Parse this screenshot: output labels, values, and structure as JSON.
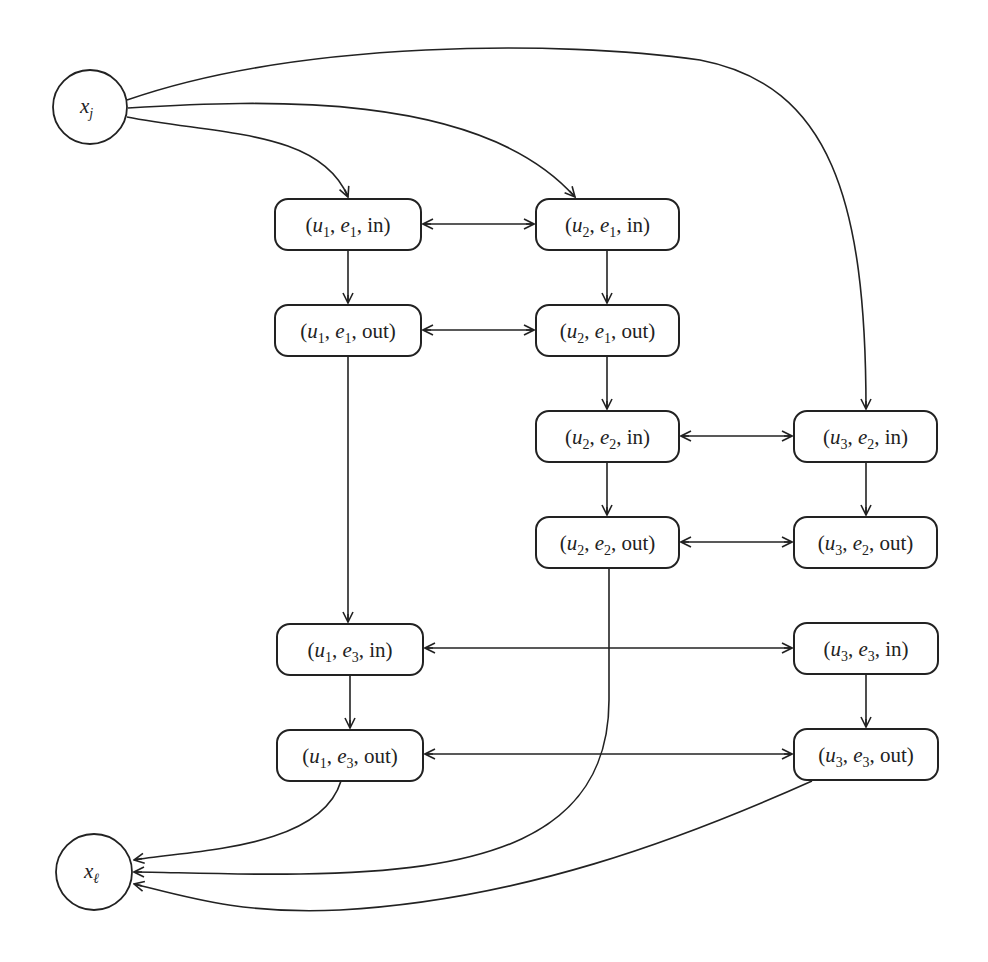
{
  "diagram": {
    "stroke_color": "#222222",
    "background": "#ffffff",
    "circle_nodes": [
      {
        "id": "xj",
        "var": "x",
        "sub": "j",
        "cx": 90,
        "cy": 107,
        "r": 37
      },
      {
        "id": "xl",
        "var": "x",
        "sub": "ℓ",
        "cx": 94,
        "cy": 872,
        "r": 38
      }
    ],
    "box_nodes": [
      {
        "id": "u1e1in",
        "u": "1",
        "e": "1",
        "kind": "in",
        "x": 275,
        "y": 199,
        "w": 146,
        "h": 51
      },
      {
        "id": "u2e1in",
        "u": "2",
        "e": "1",
        "kind": "in",
        "x": 536,
        "y": 199,
        "w": 143,
        "h": 51
      },
      {
        "id": "u1e1out",
        "u": "1",
        "e": "1",
        "kind": "out",
        "x": 275,
        "y": 305,
        "w": 146,
        "h": 51
      },
      {
        "id": "u2e1out",
        "u": "2",
        "e": "1",
        "kind": "out",
        "x": 536,
        "y": 305,
        "w": 143,
        "h": 51
      },
      {
        "id": "u2e2in",
        "u": "2",
        "e": "2",
        "kind": "in",
        "x": 536,
        "y": 411,
        "w": 143,
        "h": 51
      },
      {
        "id": "u3e2in",
        "u": "3",
        "e": "2",
        "kind": "in",
        "x": 794,
        "y": 411,
        "w": 143,
        "h": 51
      },
      {
        "id": "u2e2out",
        "u": "2",
        "e": "2",
        "kind": "out",
        "x": 536,
        "y": 517,
        "w": 143,
        "h": 51
      },
      {
        "id": "u3e2out",
        "u": "3",
        "e": "2",
        "kind": "out",
        "x": 794,
        "y": 517,
        "w": 143,
        "h": 51
      },
      {
        "id": "u1e3in",
        "u": "1",
        "e": "3",
        "kind": "in",
        "x": 277,
        "y": 624,
        "w": 146,
        "h": 51
      },
      {
        "id": "u3e3in",
        "u": "3",
        "e": "3",
        "kind": "in",
        "x": 794,
        "y": 623,
        "w": 144,
        "h": 51
      },
      {
        "id": "u1e3out",
        "u": "1",
        "e": "3",
        "kind": "out",
        "x": 277,
        "y": 730,
        "w": 146,
        "h": 51
      },
      {
        "id": "u3e3out",
        "u": "3",
        "e": "3",
        "kind": "out",
        "x": 794,
        "y": 729,
        "w": 144,
        "h": 51
      }
    ],
    "edges": [
      {
        "from": "xj",
        "to": "u1e1in",
        "path": "M127,117 C220,135 320,130 348,197",
        "ends": "end"
      },
      {
        "from": "xj",
        "to": "u2e1in",
        "path": "M128,108 C260,100 480,90 575,197",
        "ends": "end"
      },
      {
        "from": "xj",
        "to": "u3e2in",
        "path": "M127,100 C300,40 560,40 700,60 C830,85 866,200 866,409",
        "ends": "end"
      },
      {
        "from": "u1e1in",
        "to": "u2e1in",
        "path": "M423,224 L534,224",
        "ends": "both"
      },
      {
        "from": "u1e1out",
        "to": "u2e1out",
        "path": "M423,330 L534,330",
        "ends": "both"
      },
      {
        "from": "u2e2in",
        "to": "u3e2in",
        "path": "M681,436 L792,436",
        "ends": "both"
      },
      {
        "from": "u2e2out",
        "to": "u3e2out",
        "path": "M681,542 L792,542",
        "ends": "both"
      },
      {
        "from": "u1e3in",
        "to": "u3e3in",
        "path": "M425,648 L792,648",
        "ends": "both"
      },
      {
        "from": "u1e3out",
        "to": "u3e3out",
        "path": "M425,754 L792,754",
        "ends": "both"
      },
      {
        "from": "u1e1in",
        "to": "u1e1out",
        "path": "M348,250 L348,303",
        "ends": "end"
      },
      {
        "from": "u2e1in",
        "to": "u2e1out",
        "path": "M607,250 L607,303",
        "ends": "end"
      },
      {
        "from": "u2e1out",
        "to": "u2e2in",
        "path": "M607,356 L607,409",
        "ends": "end"
      },
      {
        "from": "u2e2in",
        "to": "u2e2out",
        "path": "M607,462 L607,515",
        "ends": "end"
      },
      {
        "from": "u3e2in",
        "to": "u3e2out",
        "path": "M866,462 L866,515",
        "ends": "end"
      },
      {
        "from": "u1e1out",
        "to": "u1e3in",
        "path": "M348,356 L348,622",
        "ends": "end"
      },
      {
        "from": "u1e3in",
        "to": "u1e3out",
        "path": "M350,675 L350,728",
        "ends": "end"
      },
      {
        "from": "u3e3in",
        "to": "u3e3out",
        "path": "M866,674 L866,727",
        "ends": "end"
      },
      {
        "from": "u1e3out",
        "to": "xl",
        "path": "M341,781 C320,850 190,850 134,860",
        "ends": "end"
      },
      {
        "from": "u2e2out",
        "to": "xl",
        "path": "M609,568 L609,700 C609,840 480,872 300,874 C220,875 170,872 134,872",
        "ends": "end"
      },
      {
        "from": "u3e3out",
        "to": "xl",
        "path": "M812,781 C680,840 520,900 340,910 C240,915 180,895 134,884",
        "ends": "end"
      }
    ]
  }
}
